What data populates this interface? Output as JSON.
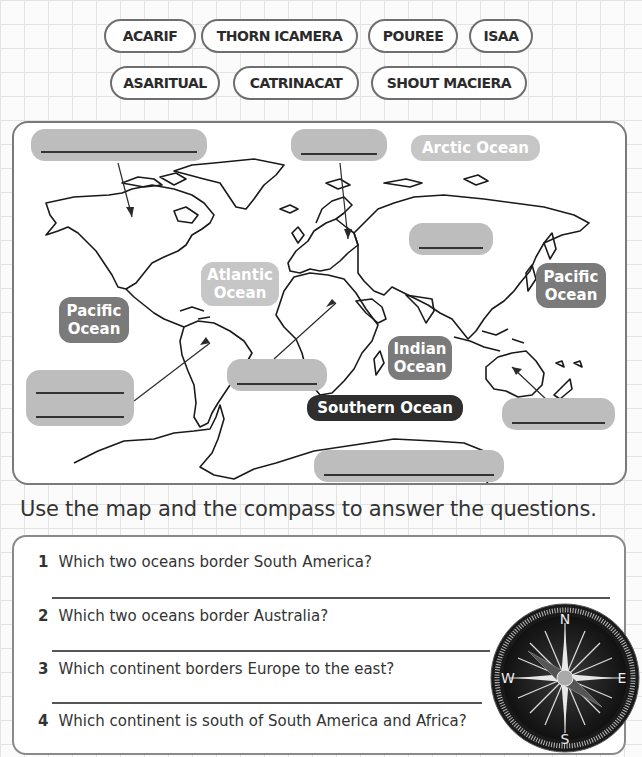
{
  "word_bank": {
    "row1": [
      "ACARIF",
      "THORN ICAMERA",
      "POUREE",
      "ISAA"
    ],
    "row2": [
      "ASARITUAL",
      "CATRINACAT",
      "SHOUT MACIERA"
    ]
  },
  "map": {
    "ocean_labels": {
      "arctic": "Arctic Ocean",
      "atlantic_line1": "Atlantic",
      "atlantic_line2": "Ocean",
      "pacific_east_line1": "Pacific",
      "pacific_east_line2": "Ocean",
      "pacific_west_line1": "Pacific",
      "pacific_west_line2": "Ocean",
      "indian_line1": "Indian",
      "indian_line2": "Ocean",
      "southern": "Southern Ocean"
    },
    "colors": {
      "light_label": "#bdbdbd",
      "mid_label": "#7d7d7d",
      "dark_label": "#2e2e2e",
      "blank_box": "#bdbdbd"
    },
    "answer_blanks": [
      {
        "for": "North America",
        "value": ""
      },
      {
        "for": "Europe",
        "value": ""
      },
      {
        "for": "Asia",
        "value": ""
      },
      {
        "for": "South America",
        "value": ""
      },
      {
        "for": "Africa",
        "value": ""
      },
      {
        "for": "Australia",
        "value": ""
      },
      {
        "for": "Antarctica",
        "value": ""
      }
    ]
  },
  "instruction": "Use the map and the compass to answer the questions.",
  "questions": [
    {
      "num": "1",
      "text": "Which two oceans border South America?",
      "answer": ""
    },
    {
      "num": "2",
      "text": "Which two oceans border Australia?",
      "answer": ""
    },
    {
      "num": "3",
      "text": "Which continent borders Europe to the east?",
      "answer": ""
    },
    {
      "num": "4",
      "text": "Which continent is south of South America and Africa?",
      "answer": ""
    }
  ],
  "compass": {
    "n": "N",
    "e": "E",
    "s": "S",
    "w": "W"
  }
}
